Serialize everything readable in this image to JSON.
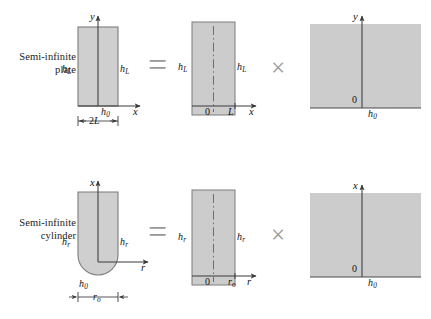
{
  "figure": {
    "width": 431,
    "height": 319,
    "colors": {
      "body_fill": "#cfcfcf",
      "body_stroke": "#7d7d7d",
      "panel_fill": "#cccccc",
      "axis": "#3a3a3a",
      "operator": "#9a9a9a",
      "text": "#111111",
      "background": "#ffffff"
    }
  },
  "rows": [
    {
      "id": "plate",
      "label": "Semi-infinite\nplate",
      "label_line1": "Semi-infinite",
      "label_line2": "plate",
      "operator_equals": "=",
      "operator_times": "×",
      "panels": [
        {
          "id": "plate-solid",
          "shape": "rectangle",
          "vertical_axis": "y",
          "horizontal_axis": "x",
          "left_coefficient": "h",
          "left_coefficient_sub": "L",
          "right_coefficient": "h",
          "right_coefficient_sub": "L",
          "bottom_coefficient": "h",
          "bottom_coefficient_sub": "0",
          "dimension": "2L",
          "dimension_symbol": "2",
          "dimension_sub": "L"
        },
        {
          "id": "plate-slab",
          "shape": "slab",
          "vertical_axis": "",
          "horizontal_axis": "x",
          "left_coefficient": "h",
          "left_coefficient_sub": "L",
          "right_coefficient": "h",
          "right_coefficient_sub": "L",
          "origin": "0",
          "tick_label": "L",
          "centerline": "dash-dot"
        },
        {
          "id": "plate-halfspace",
          "shape": "half-space",
          "vertical_axis": "y",
          "origin": "0",
          "bottom_coefficient": "h",
          "bottom_coefficient_sub": "0"
        }
      ]
    },
    {
      "id": "cylinder",
      "label": "Semi-infinite\ncylinder",
      "label_line1": "Semi-infinite",
      "label_line2": "cylinder",
      "operator_equals": "=",
      "operator_times": "×",
      "panels": [
        {
          "id": "cylinder-solid",
          "shape": "rounded-bottom-rectangle",
          "vertical_axis": "x",
          "horizontal_axis": "r",
          "left_coefficient": "h",
          "left_coefficient_sub": "r",
          "right_coefficient": "h",
          "right_coefficient_sub": "r",
          "bottom_coefficient": "h",
          "bottom_coefficient_sub": "0",
          "dimension": "r₀",
          "dimension_symbol": "r",
          "dimension_sub": "o"
        },
        {
          "id": "cylinder-rod",
          "shape": "slab",
          "vertical_axis": "",
          "horizontal_axis": "r",
          "left_coefficient": "h",
          "left_coefficient_sub": "r",
          "right_coefficient": "h",
          "right_coefficient_sub": "r",
          "origin": "0",
          "tick_label": "r",
          "tick_label_sub": "o",
          "centerline": "dash-dot"
        },
        {
          "id": "cylinder-halfspace",
          "shape": "half-space",
          "vertical_axis": "x",
          "origin": "0",
          "bottom_coefficient": "h",
          "bottom_coefficient_sub": "0"
        }
      ]
    }
  ]
}
